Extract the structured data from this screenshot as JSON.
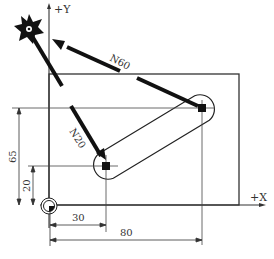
{
  "diagram": {
    "axes": {
      "y_label": "+Y",
      "x_label": "+X"
    },
    "paths": {
      "n60": "N60",
      "n20": "N20"
    },
    "dimensions": {
      "vertical_outer": "65",
      "vertical_inner": "20",
      "horizontal_inner": "30",
      "horizontal_outer": "80"
    },
    "icons": {
      "tool": "milling-cutter-icon",
      "origin": "workpiece-origin-icon"
    }
  }
}
